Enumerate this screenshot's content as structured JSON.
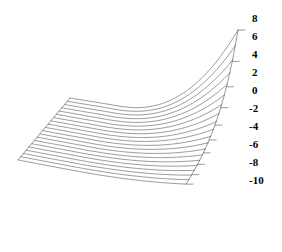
{
  "figure": {
    "title": "",
    "background_color": "#ffffff",
    "line_color": "#6f6f6f",
    "label_color": "#000000",
    "width": 282,
    "height": 252
  },
  "chart_data": {
    "type": "line",
    "title": "",
    "xlabel": "",
    "ylabel": "",
    "zlabel": "",
    "grid": false,
    "legend": false,
    "projection": "3d-waterfall",
    "axis": {
      "name": "depth-axis",
      "position": "right",
      "tick_labels": [
        "8",
        "6",
        "4",
        "2",
        "0",
        "-2",
        "-4",
        "-6",
        "-8",
        "-10"
      ],
      "tick_values": [
        8,
        6,
        4,
        2,
        0,
        -2,
        -4,
        -6,
        -8,
        -10
      ],
      "range": [
        -10,
        8
      ],
      "step": -2
    },
    "n_curves": 20,
    "curve_labels": [
      "8",
      "7",
      "6",
      "5",
      "4",
      "3",
      "2",
      "1",
      "0",
      "-1",
      "-2",
      "-3",
      "-4",
      "-5",
      "-6",
      "-7",
      "-8",
      "-9",
      "-10",
      "-11"
    ],
    "series": [
      {
        "name": "8",
        "values": [
          0.0,
          0.02,
          0.06,
          0.14,
          0.28,
          0.5,
          0.78,
          1.0
        ]
      },
      {
        "name": "7",
        "values": [
          0.0,
          0.01,
          0.04,
          0.1,
          0.21,
          0.39,
          0.64,
          0.88
        ]
      },
      {
        "name": "6",
        "values": [
          0.0,
          0.01,
          0.03,
          0.08,
          0.17,
          0.32,
          0.54,
          0.77
        ]
      },
      {
        "name": "5",
        "values": [
          0.0,
          0.01,
          0.03,
          0.07,
          0.14,
          0.27,
          0.46,
          0.68
        ]
      },
      {
        "name": "4",
        "values": [
          0.0,
          0.01,
          0.02,
          0.06,
          0.12,
          0.23,
          0.4,
          0.6
        ]
      },
      {
        "name": "3",
        "values": [
          0.0,
          0.01,
          0.02,
          0.05,
          0.1,
          0.2,
          0.35,
          0.53
        ]
      },
      {
        "name": "2",
        "values": [
          0.0,
          0.01,
          0.02,
          0.04,
          0.09,
          0.18,
          0.31,
          0.48
        ]
      },
      {
        "name": "1",
        "values": [
          0.0,
          0.0,
          0.01,
          0.04,
          0.08,
          0.16,
          0.28,
          0.43
        ]
      },
      {
        "name": "0",
        "values": [
          0.0,
          0.0,
          0.01,
          0.03,
          0.07,
          0.14,
          0.25,
          0.39
        ]
      },
      {
        "name": "-1",
        "values": [
          0.0,
          0.0,
          0.01,
          0.03,
          0.06,
          0.13,
          0.23,
          0.36
        ]
      },
      {
        "name": "-2",
        "values": [
          0.0,
          0.0,
          0.01,
          0.03,
          0.06,
          0.12,
          0.21,
          0.33
        ]
      },
      {
        "name": "-3",
        "values": [
          0.0,
          0.0,
          0.01,
          0.02,
          0.05,
          0.11,
          0.19,
          0.3
        ]
      },
      {
        "name": "-4",
        "values": [
          0.0,
          0.0,
          0.01,
          0.02,
          0.05,
          0.1,
          0.18,
          0.28
        ]
      },
      {
        "name": "-5",
        "values": [
          0.0,
          0.0,
          0.01,
          0.02,
          0.05,
          0.09,
          0.17,
          0.26
        ]
      },
      {
        "name": "-6",
        "values": [
          0.0,
          0.0,
          0.01,
          0.02,
          0.04,
          0.09,
          0.16,
          0.25
        ]
      },
      {
        "name": "-7",
        "values": [
          0.0,
          0.0,
          0.01,
          0.02,
          0.04,
          0.08,
          0.15,
          0.23
        ]
      },
      {
        "name": "-8",
        "values": [
          0.0,
          0.0,
          0.01,
          0.02,
          0.04,
          0.08,
          0.14,
          0.22
        ]
      },
      {
        "name": "-9",
        "values": [
          0.0,
          0.0,
          0.01,
          0.02,
          0.04,
          0.07,
          0.13,
          0.21
        ]
      },
      {
        "name": "-10",
        "values": [
          0.0,
          0.0,
          0.01,
          0.02,
          0.03,
          0.07,
          0.13,
          0.2
        ]
      },
      {
        "name": "-11",
        "values": [
          0.0,
          0.0,
          0.01,
          0.02,
          0.03,
          0.07,
          0.12,
          0.19
        ]
      }
    ],
    "geometry": {
      "front_left_x": 18,
      "front_left_y": 160,
      "front_right_x": 186,
      "front_right_y": 192,
      "depth_dx": 52,
      "depth_dy": -62,
      "n_samples": 90,
      "top_curve_amplitude": 100,
      "amplitude_decay": 0.875,
      "flat_fraction": 0.26,
      "curve_exponent": 2.35
    }
  },
  "tick_labels": [
    {
      "text": "8",
      "x": 252,
      "y": 13
    },
    {
      "text": "6",
      "x": 252,
      "y": 31
    },
    {
      "text": "4",
      "x": 252,
      "y": 49
    },
    {
      "text": "2",
      "x": 252,
      "y": 67
    },
    {
      "text": "0",
      "x": 252,
      "y": 85
    },
    {
      "text": "-2",
      "x": 249,
      "y": 103
    },
    {
      "text": "-4",
      "x": 249,
      "y": 121
    },
    {
      "text": "-6",
      "x": 249,
      "y": 139
    },
    {
      "text": "-8",
      "x": 249,
      "y": 157
    },
    {
      "text": "-10",
      "x": 249,
      "y": 175
    }
  ]
}
